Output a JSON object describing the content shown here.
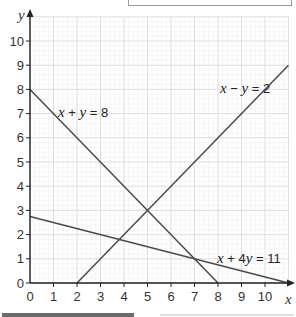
{
  "chart_data": {
    "type": "line",
    "title": "",
    "xlabel": "x",
    "ylabel": "y",
    "xlim": [
      0,
      11
    ],
    "ylim": [
      0,
      11
    ],
    "x_ticks": [
      "0",
      "1",
      "2",
      "3",
      "4",
      "5",
      "6",
      "7",
      "8",
      "9",
      "10"
    ],
    "y_ticks": [
      "0",
      "1",
      "2",
      "3",
      "4",
      "5",
      "6",
      "7",
      "8",
      "9",
      "10"
    ],
    "grid": {
      "major": true,
      "minor": true,
      "minor_step": 0.2
    },
    "legend": "none (inline labels)",
    "series": [
      {
        "name": "x + y = 8",
        "equation": "x+y=8",
        "points": [
          [
            0,
            8
          ],
          [
            8,
            0
          ]
        ],
        "label_pos": [
          2.1,
          7.3
        ]
      },
      {
        "name": "x − y = 2",
        "equation": "x-y=2",
        "points": [
          [
            2,
            0
          ],
          [
            11,
            9
          ]
        ],
        "label_pos": [
          8.2,
          7.7
        ]
      },
      {
        "name": "x + 4y = 11",
        "equation": "x+4y=11",
        "points": [
          [
            0,
            2.75
          ],
          [
            11,
            0
          ]
        ],
        "label_pos": [
          7.9,
          1.25
        ]
      }
    ],
    "intersections": [
      {
        "lines": [
          "x+y=8",
          "x-y=2"
        ],
        "point": [
          5,
          3
        ]
      },
      {
        "lines": [
          "x+y=8",
          "x+4y=11"
        ],
        "point": [
          7,
          1
        ]
      },
      {
        "lines": [
          "x-y=2",
          "x+4y=11"
        ],
        "point": [
          3.8,
          1.8
        ]
      }
    ]
  },
  "labels": {
    "x_axis": "x",
    "y_axis": "y",
    "line1": {
      "a": "x",
      "op1": " + ",
      "b": "y",
      "rest": " = 8"
    },
    "line2": {
      "a": "x",
      "op1": " − ",
      "b": "y",
      "rest": " = 2"
    },
    "line3": {
      "a": "x",
      "op1": " + 4",
      "b": "y",
      "rest": " = 11"
    }
  },
  "colors": {
    "line": "#4a4a4a",
    "axis": "#222222",
    "grid_major": "#d6d6d6",
    "grid_minor": "#ececec"
  }
}
